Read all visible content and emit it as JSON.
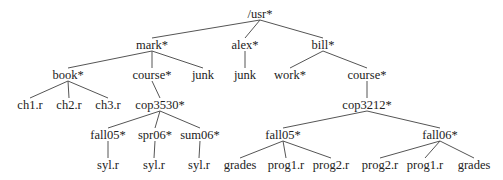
{
  "diagram": {
    "type": "directory-tree",
    "nodes": [
      {
        "id": "usr",
        "label": "/usr*",
        "x": 260,
        "y": 14
      },
      {
        "id": "mark",
        "label": "mark*",
        "x": 152,
        "y": 45
      },
      {
        "id": "alex",
        "label": "alex*",
        "x": 245,
        "y": 45
      },
      {
        "id": "bill",
        "label": "bill*",
        "x": 323,
        "y": 45
      },
      {
        "id": "book",
        "label": "book*",
        "x": 68,
        "y": 75
      },
      {
        "id": "mark_course",
        "label": "course*",
        "x": 152,
        "y": 75
      },
      {
        "id": "mark_junk",
        "label": "junk",
        "x": 203,
        "y": 75
      },
      {
        "id": "alex_junk",
        "label": "junk",
        "x": 245,
        "y": 75
      },
      {
        "id": "work",
        "label": "work*",
        "x": 290,
        "y": 75
      },
      {
        "id": "bill_course",
        "label": "course*",
        "x": 367,
        "y": 75
      },
      {
        "id": "ch1",
        "label": "ch1.r",
        "x": 30,
        "y": 105
      },
      {
        "id": "ch2",
        "label": "ch2.r",
        "x": 69,
        "y": 105
      },
      {
        "id": "ch3",
        "label": "ch3.r",
        "x": 108,
        "y": 105
      },
      {
        "id": "cop3530",
        "label": "cop3530*",
        "x": 160,
        "y": 105
      },
      {
        "id": "cop3212",
        "label": "cop3212*",
        "x": 367,
        "y": 105
      },
      {
        "id": "m_fall05",
        "label": "fall05*",
        "x": 108,
        "y": 135
      },
      {
        "id": "spr06",
        "label": "spr06*",
        "x": 155,
        "y": 135
      },
      {
        "id": "sum06",
        "label": "sum06*",
        "x": 200,
        "y": 135
      },
      {
        "id": "b_fall05",
        "label": "fall05*",
        "x": 283,
        "y": 135
      },
      {
        "id": "b_fall06",
        "label": "fall06*",
        "x": 440,
        "y": 135
      },
      {
        "id": "syl1",
        "label": "syl.r",
        "x": 108,
        "y": 165
      },
      {
        "id": "syl2",
        "label": "syl.r",
        "x": 154,
        "y": 165
      },
      {
        "id": "syl3",
        "label": "syl.r",
        "x": 199,
        "y": 165
      },
      {
        "id": "grades1",
        "label": "grades",
        "x": 240,
        "y": 165
      },
      {
        "id": "f05_prog1",
        "label": "prog1.r",
        "x": 286,
        "y": 165
      },
      {
        "id": "f05_prog2",
        "label": "prog2.r",
        "x": 331,
        "y": 165
      },
      {
        "id": "f06_prog2",
        "label": "prog2.r",
        "x": 380,
        "y": 165
      },
      {
        "id": "f06_prog1",
        "label": "prog1.r",
        "x": 425,
        "y": 165
      },
      {
        "id": "grades2",
        "label": "grades",
        "x": 474,
        "y": 165
      }
    ],
    "edges": [
      [
        "usr",
        "mark"
      ],
      [
        "usr",
        "alex"
      ],
      [
        "usr",
        "bill"
      ],
      [
        "mark",
        "book"
      ],
      [
        "mark",
        "mark_course"
      ],
      [
        "mark",
        "mark_junk"
      ],
      [
        "alex",
        "alex_junk"
      ],
      [
        "bill",
        "work"
      ],
      [
        "bill",
        "bill_course"
      ],
      [
        "book",
        "ch1"
      ],
      [
        "book",
        "ch2"
      ],
      [
        "book",
        "ch3"
      ],
      [
        "mark_course",
        "cop3530"
      ],
      [
        "bill_course",
        "cop3212"
      ],
      [
        "cop3530",
        "m_fall05"
      ],
      [
        "cop3530",
        "spr06"
      ],
      [
        "cop3530",
        "sum06"
      ],
      [
        "cop3212",
        "b_fall05"
      ],
      [
        "cop3212",
        "b_fall06"
      ],
      [
        "m_fall05",
        "syl1"
      ],
      [
        "spr06",
        "syl2"
      ],
      [
        "sum06",
        "syl3"
      ],
      [
        "b_fall05",
        "grades1"
      ],
      [
        "b_fall05",
        "f05_prog1"
      ],
      [
        "b_fall05",
        "f05_prog2"
      ],
      [
        "b_fall06",
        "f06_prog2"
      ],
      [
        "b_fall06",
        "f06_prog1"
      ],
      [
        "b_fall06",
        "grades2"
      ]
    ]
  },
  "style": {
    "edge_color": "#555555",
    "text_color": "#222222",
    "background": "#ffffff"
  }
}
